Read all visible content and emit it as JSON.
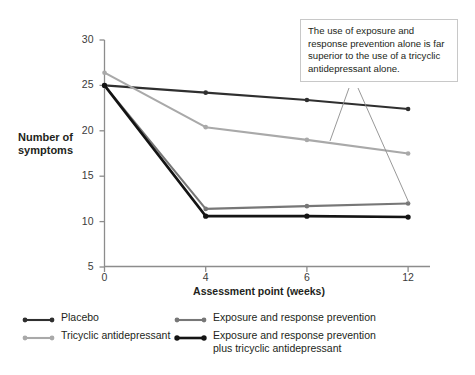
{
  "chart_data": {
    "type": "line",
    "title": "",
    "subtitle": "",
    "xlabel": "Assessment point (weeks)",
    "ylabel": "Number of\nsymptoms",
    "categories": [
      "0",
      "4",
      "6",
      "12"
    ],
    "x_tick_labels": [
      "0",
      "4",
      "6",
      "12"
    ],
    "y_tick_labels": [
      "30",
      "25",
      "20",
      "15",
      "10",
      "5"
    ],
    "y_ticks": [
      30,
      25,
      20,
      15,
      10,
      5
    ],
    "ylim": [
      5,
      30
    ],
    "grid": false,
    "legend_position": "bottom",
    "series": [
      {
        "name": "Placebo",
        "color": "#2f2f2f",
        "width": 2.1,
        "values": [
          25.0,
          24.2,
          23.4,
          22.4
        ]
      },
      {
        "name": "Tricyclic antidepressant",
        "color": "#a9a9a9",
        "width": 2.1,
        "values": [
          26.4,
          20.4,
          19.0,
          17.5
        ]
      },
      {
        "name": "Exposure and response prevention",
        "color": "#777777",
        "width": 2.1,
        "values": [
          25.0,
          11.4,
          11.7,
          12.0
        ]
      },
      {
        "name": "Exposure and response prevention plus tricyclic antidepressant",
        "color": "#141414",
        "width": 2.6,
        "values": [
          25.0,
          10.6,
          10.6,
          10.5
        ]
      }
    ],
    "annotations": [
      {
        "text": "The use of exposure and response prevention alone is far superior to the use of a tricyclic antidepressant alone.",
        "points_to": [
          "Tricyclic antidepressant @ week 6-12",
          "Exposure and response prevention @ week 12"
        ]
      }
    ]
  },
  "axes": {
    "y_title": "Number of\nsymptoms",
    "x_title": "Assessment point (weeks)",
    "y_ticks": [
      "30",
      "25",
      "20",
      "15",
      "10",
      "5"
    ],
    "x_ticks": [
      "0",
      "4",
      "6",
      "12"
    ]
  },
  "callout": {
    "text": "The use of exposure and response prevention alone is far superior to the use of a tricyclic antidepressant alone."
  },
  "legend": {
    "items": [
      {
        "label": "Placebo",
        "color": "#2f2f2f",
        "width": 2.1
      },
      {
        "label": "Tricyclic antidepressant",
        "color": "#a9a9a9",
        "width": 2.1
      },
      {
        "label": "Exposure and response prevention",
        "color": "#777777",
        "width": 2.1
      },
      {
        "label": "Exposure and response prevention\nplus tricyclic antidepressant",
        "color": "#141414",
        "width": 2.6
      }
    ]
  }
}
